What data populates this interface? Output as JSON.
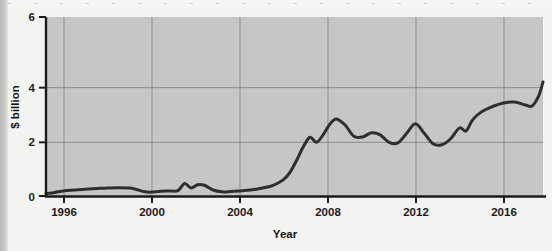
{
  "figure": {
    "background_color": "#f3f3f1",
    "plot_area_color": "#c6c6c4",
    "line_color": "#2e2e2e",
    "axis_color": "#1b1b1b",
    "grid_color": "#8f8f8d"
  },
  "chart_data": {
    "type": "line",
    "title": "",
    "xlabel": "Year",
    "ylabel": "$ billion",
    "xlim": [
      1995.2,
      2017.8
    ],
    "ylim": [
      0,
      6
    ],
    "xticks": [
      1996,
      2000,
      2004,
      2008,
      2012,
      2016
    ],
    "xtick_labels": [
      "1996",
      "2000",
      "2004",
      "2008",
      "2012",
      "2016"
    ],
    "yticks": [
      0,
      2,
      4,
      6
    ],
    "ytick_labels": [
      "0",
      "2",
      "4",
      "6"
    ],
    "grid": true,
    "grid_axis": "both",
    "legend": false,
    "legend_position": "none",
    "series": [
      {
        "name": "$ billion",
        "x": [
          1995.2,
          1995.6,
          1996,
          1996.5,
          1997,
          1997.5,
          1998,
          1998.5,
          1999,
          1999.3,
          1999.7,
          2000,
          2000.4,
          2000.8,
          2001.2,
          2001.5,
          2001.8,
          2002.1,
          2002.4,
          2002.8,
          2003.2,
          2003.6,
          2004,
          2004.5,
          2005,
          2005.5,
          2006,
          2006.3,
          2006.6,
          2006.9,
          2007.2,
          2007.5,
          2007.8,
          2008.1,
          2008.4,
          2008.8,
          2009.2,
          2009.6,
          2010,
          2010.4,
          2010.8,
          2011.2,
          2011.6,
          2012,
          2012.4,
          2012.8,
          2013.2,
          2013.6,
          2014,
          2014.3,
          2014.6,
          2015,
          2015.5,
          2016,
          2016.5,
          2017,
          2017.3,
          2017.6,
          2017.8
        ],
        "y": [
          0.08,
          0.12,
          0.17,
          0.2,
          0.23,
          0.25,
          0.27,
          0.28,
          0.27,
          0.22,
          0.14,
          0.13,
          0.16,
          0.17,
          0.18,
          0.42,
          0.27,
          0.38,
          0.36,
          0.2,
          0.14,
          0.15,
          0.17,
          0.2,
          0.26,
          0.35,
          0.55,
          0.8,
          1.2,
          1.65,
          1.97,
          1.8,
          2.05,
          2.4,
          2.58,
          2.38,
          2.0,
          1.98,
          2.12,
          2.05,
          1.8,
          1.78,
          2.1,
          2.42,
          2.1,
          1.75,
          1.72,
          1.92,
          2.28,
          2.18,
          2.55,
          2.82,
          3.0,
          3.12,
          3.15,
          3.05,
          3.02,
          3.35,
          3.82
        ]
      }
    ]
  },
  "axis_labels": {
    "y_axis_title": "$ billion",
    "x_axis_title": "Year"
  }
}
